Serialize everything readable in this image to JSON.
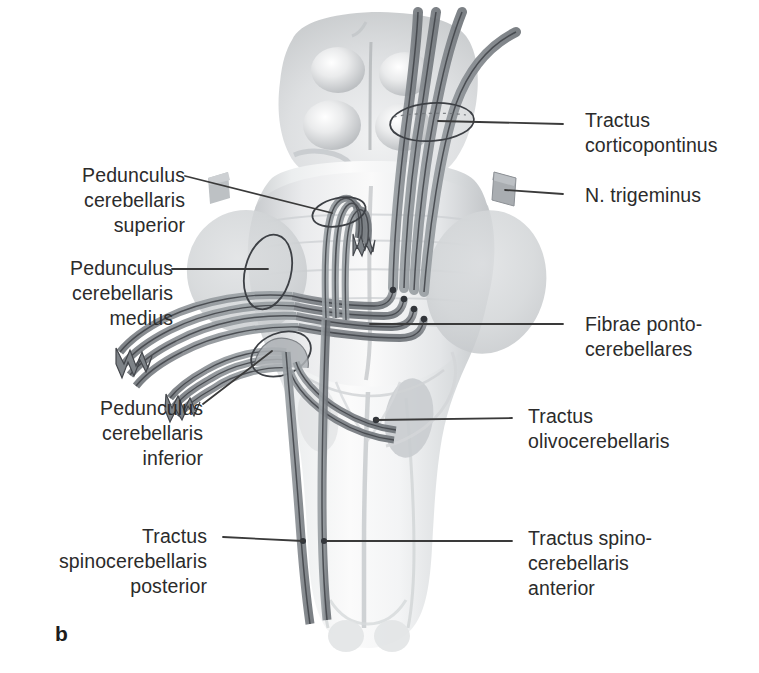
{
  "figure": {
    "letter": "b",
    "caption_language": "la",
    "background_color": "#ffffff",
    "text_color": "#2b2b2b",
    "leader_color": "#3a3a3a",
    "tract_fill": "#8d9094",
    "tract_outline": "#4a4d52",
    "brainstem_light": "#f2f3f4",
    "brainstem_mid": "#d8dadc",
    "brainstem_shadow": "#b9bcbf"
  },
  "labels": [
    {
      "id": "tractus-corticopontinus",
      "text": "Tractus\ncorticopontinus",
      "align": "left",
      "x": 585,
      "y": 108,
      "leader": {
        "from_x": 563,
        "from_y": 124,
        "to_x": 438,
        "to_y": 121
      }
    },
    {
      "id": "n-trigeminus",
      "text": "N. trigeminus",
      "align": "left",
      "x": 585,
      "y": 183,
      "leader": {
        "from_x": 563,
        "from_y": 194,
        "to_x": 505,
        "to_y": 190
      }
    },
    {
      "id": "fibrae-pontocerebellares",
      "text": "Fibrae ponto-\ncerebellares",
      "align": "left",
      "x": 585,
      "y": 312,
      "leader": {
        "from_x": 563,
        "from_y": 324,
        "to_x": 370,
        "to_y": 324
      }
    },
    {
      "id": "tractus-olivocerebellaris",
      "text": "Tractus\nolivocerebellaris",
      "align": "left",
      "x": 528,
      "y": 404,
      "leader": {
        "from_x": 512,
        "from_y": 418,
        "to_x": 376,
        "to_y": 420
      }
    },
    {
      "id": "tractus-spinocerebellaris-anterior",
      "text": "Tractus spino-\ncerebellaris\nanterior",
      "align": "left",
      "x": 528,
      "y": 526,
      "leader": {
        "from_x": 512,
        "from_y": 541,
        "to_x": 327,
        "to_y": 541
      }
    },
    {
      "id": "pedunculus-cerebellaris-superior",
      "text": "Pedunculus\ncerebellaris\nsuperior",
      "align": "right",
      "x": 30,
      "y": 163,
      "leader": {
        "from_x": 185,
        "from_y": 176,
        "to_x": 332,
        "to_y": 213
      }
    },
    {
      "id": "pedunculus-cerebellaris-medius",
      "text": "Pedunculus\ncerebellaris\nmedius",
      "align": "right",
      "x": 18,
      "y": 256,
      "leader": {
        "from_x": 172,
        "from_y": 269,
        "to_x": 268,
        "to_y": 269
      }
    },
    {
      "id": "pedunculus-cerebellaris-inferior",
      "text": "Pedunculus\ncerebellaris\ninferior",
      "align": "right",
      "x": 48,
      "y": 396,
      "leader": {
        "from_x": 203,
        "from_y": 404,
        "to_x": 272,
        "to_y": 351
      }
    },
    {
      "id": "tractus-spinocerebellaris-posterior",
      "text": "Tractus\nspinocerebellaris\nposterior",
      "align": "right",
      "x": 52,
      "y": 524,
      "leader": {
        "from_x": 223,
        "from_y": 537,
        "to_x": 303,
        "to_y": 541
      }
    }
  ],
  "anatomy": {
    "structures": [
      {
        "name": "colliculi-superiores",
        "note": "paired rounded eminences, upper"
      },
      {
        "name": "colliculi-inferiores",
        "note": "paired rounded eminences, lower"
      },
      {
        "name": "pons",
        "note": "central bulging body"
      },
      {
        "name": "medulla-oblongata",
        "note": "lower tapering trunk"
      },
      {
        "name": "oliva",
        "note": "oval gray prominence on medulla"
      },
      {
        "name": "pedunculus-cerebri",
        "note": "lateral columns"
      }
    ],
    "tract_bundles": [
      {
        "name": "corticopontine-fibers",
        "count": 4
      },
      {
        "name": "pontocerebellar-fibers",
        "count": 4
      },
      {
        "name": "middle-peduncle-fibers",
        "count": 4
      },
      {
        "name": "inferior-peduncle-fibers",
        "count": 4
      },
      {
        "name": "superior-peduncle-fibers",
        "count": 3
      },
      {
        "name": "spinocerebellar-tracts",
        "count": 2
      },
      {
        "name": "olivocerebellar-fibers",
        "count": 2
      }
    ],
    "cut_markers": [
      {
        "name": "ellipse-corticopontinus",
        "cx": 432,
        "cy": 122,
        "rx": 42,
        "ry": 19
      },
      {
        "name": "ellipse-pedunculus-superior",
        "cx": 339,
        "cy": 212,
        "rx": 28,
        "ry": 15
      },
      {
        "name": "ellipse-pedunculus-medius",
        "cx": 268,
        "cy": 272,
        "rx": 24,
        "ry": 38
      },
      {
        "name": "ellipse-pedunculus-inferior",
        "cx": 281,
        "cy": 354,
        "rx": 32,
        "ry": 22
      }
    ]
  }
}
